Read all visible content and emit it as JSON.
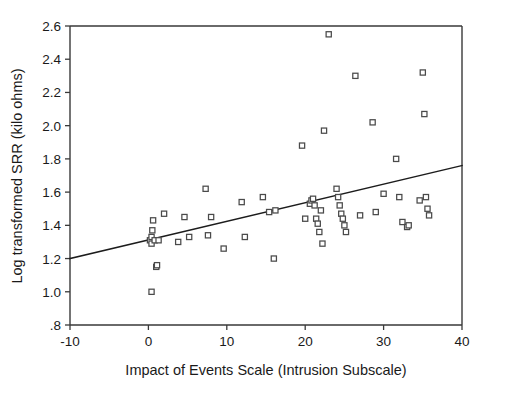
{
  "chart_data": {
    "type": "scatter",
    "title": "",
    "xlabel": "Impact of Events Scale (Intrusion Subscale)",
    "ylabel": "Log transformed SRR (kilo ohms)",
    "xlim": [
      -10,
      40
    ],
    "ylim": [
      0.8,
      2.6
    ],
    "xticks": [
      -10,
      0,
      10,
      20,
      30,
      40
    ],
    "xtick_labels": [
      "-10",
      "0",
      "10",
      "20",
      "30",
      "40"
    ],
    "yticks": [
      0.8,
      1.0,
      1.2,
      1.4,
      1.6,
      1.8,
      2.0,
      2.2,
      2.4,
      2.6
    ],
    "ytick_labels": [
      ".8",
      "1.0",
      "1.2",
      "1.4",
      "1.6",
      "1.8",
      "2.0",
      "2.2",
      "2.4",
      "2.6"
    ],
    "grid": false,
    "legend": null,
    "marker": "open-square",
    "marker_color": "#4a4a4a",
    "fit_line": {
      "label": "linear regression line",
      "x": [
        -10,
        40
      ],
      "y": [
        1.2,
        1.76
      ],
      "color": "#1c1c1c"
    },
    "x": [
      0.2,
      0.4,
      0.4,
      0.4,
      0.5,
      0.6,
      0.8,
      1.0,
      1.1,
      1.3,
      2.0,
      3.8,
      4.6,
      5.2,
      7.3,
      7.6,
      8.0,
      9.6,
      11.9,
      12.3,
      14.6,
      15.4,
      16.0,
      16.2,
      19.6,
      20.0,
      20.6,
      20.8,
      21.0,
      21.2,
      21.4,
      21.6,
      21.8,
      22.0,
      22.2,
      22.4,
      23.0,
      24.0,
      24.2,
      24.4,
      24.6,
      24.8,
      25.0,
      25.2,
      26.4,
      27.0,
      28.6,
      29.0,
      30.0,
      31.6,
      32.0,
      32.4,
      33.0,
      33.2,
      34.6,
      35.0,
      35.2,
      35.4,
      35.6,
      35.8
    ],
    "y": [
      1.31,
      1.0,
      1.29,
      1.33,
      1.37,
      1.43,
      1.31,
      1.15,
      1.16,
      1.31,
      1.47,
      1.3,
      1.45,
      1.33,
      1.62,
      1.34,
      1.45,
      1.26,
      1.54,
      1.33,
      1.57,
      1.48,
      1.2,
      1.49,
      1.88,
      1.44,
      1.53,
      1.55,
      1.56,
      1.52,
      1.44,
      1.41,
      1.36,
      1.49,
      1.29,
      1.97,
      2.55,
      1.62,
      1.57,
      1.52,
      1.47,
      1.44,
      1.4,
      1.36,
      2.3,
      1.46,
      2.02,
      1.48,
      1.59,
      1.8,
      1.57,
      1.42,
      1.39,
      1.4,
      1.55,
      2.32,
      2.07,
      1.57,
      1.5,
      1.46
    ],
    "n_points": 60
  }
}
